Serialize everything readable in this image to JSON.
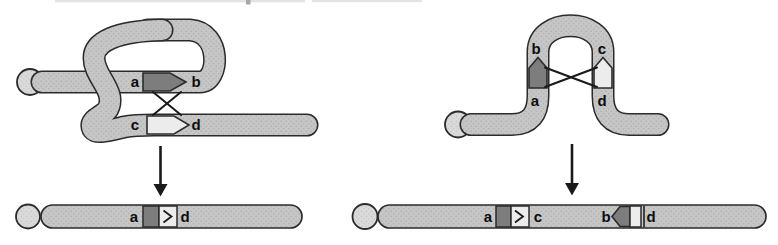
{
  "colors": {
    "chromosome_fill": "#c6c6c6",
    "chromosome_dot": "#aeaeae",
    "telomere_fill": "#dadada",
    "telomere_dot": "#c6c6c6",
    "outline": "#2b2b2b",
    "repeat_dark": "#7d7d7d",
    "repeat_light": "#ececec",
    "label_color": "#0d0d0d",
    "line_color": "#1a1a1a",
    "remnant_color": "#e3e3e3",
    "remnant_dark_color": "#a8a8a8"
  },
  "left_diagram": {
    "strand_labels": {
      "a": "a",
      "b": "b",
      "c": "c",
      "d": "d"
    },
    "product_labels": {
      "a": "a",
      "d": "d"
    }
  },
  "right_diagram": {
    "strand_labels": {
      "a": "a",
      "b": "b",
      "c": "c",
      "d": "d"
    },
    "product_labels": {
      "a": "a",
      "c": "c",
      "b": "b",
      "d": "d"
    }
  }
}
